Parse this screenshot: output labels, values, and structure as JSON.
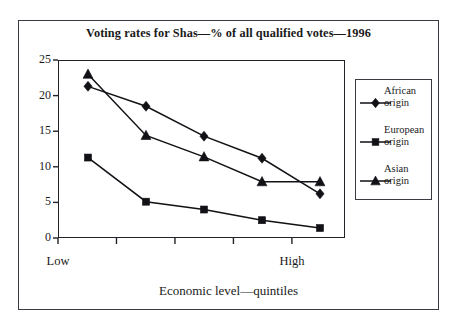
{
  "chart_data": {
    "type": "line",
    "title": "Voting rates for Shas—% of all qualified votes—1996",
    "xlabel": "Economic level—quintiles",
    "ylabel": "",
    "categories": [
      "1",
      "2",
      "3",
      "4",
      "5"
    ],
    "x_tick_labels": [
      "Low",
      "",
      "",
      "",
      "High"
    ],
    "y_tick_labels": [
      "0",
      "5",
      "10",
      "15",
      "20",
      "25"
    ],
    "y_ticks": [
      0,
      5,
      10,
      15,
      20,
      25
    ],
    "ylim": [
      0,
      25
    ],
    "grid": false,
    "legend_position": "right",
    "series": [
      {
        "name": "African origin",
        "label_line1": "African",
        "label_line2": "origin",
        "marker": "diamond",
        "color": "#111116",
        "values": [
          21.3,
          18.5,
          14.3,
          11.2,
          6.2
        ]
      },
      {
        "name": "European origin",
        "label_line1": "European",
        "label_line2": "origin",
        "marker": "square",
        "color": "#111116",
        "values": [
          11.3,
          5.1,
          4.0,
          2.5,
          1.4
        ]
      },
      {
        "name": "Asian origin",
        "label_line1": "Asian",
        "label_line2": "origin",
        "marker": "triangle",
        "color": "#111116",
        "values": [
          23.0,
          14.4,
          11.4,
          7.9,
          7.9
        ]
      }
    ]
  },
  "colors": {
    "frame": "#3a3a42",
    "axis": "#222228",
    "ink": "#111116",
    "background": "#ffffff"
  }
}
